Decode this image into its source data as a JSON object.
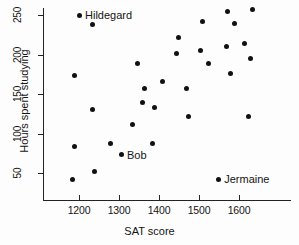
{
  "chart_data": {
    "type": "scatter",
    "title": "",
    "xlabel": "SAT score",
    "ylabel": "Hours spent studying",
    "xlim": [
      1150,
      1670
    ],
    "ylim": [
      20,
      270
    ],
    "grid": false,
    "legend": null,
    "xticks": [
      1200,
      1300,
      1400,
      1500,
      1600
    ],
    "yticks": [
      50,
      100,
      150,
      200,
      250
    ],
    "points": [
      {
        "x": 1200,
        "y": 250,
        "label": "Hildegard"
      },
      {
        "x": 1233,
        "y": 238,
        "label": null
      },
      {
        "x": 1188,
        "y": 173,
        "label": null
      },
      {
        "x": 1233,
        "y": 131,
        "label": null
      },
      {
        "x": 1188,
        "y": 83,
        "label": null
      },
      {
        "x": 1278,
        "y": 87,
        "label": null
      },
      {
        "x": 1238,
        "y": 52,
        "label": null
      },
      {
        "x": 1183,
        "y": 42,
        "label": null
      },
      {
        "x": 1333,
        "y": 112,
        "label": null
      },
      {
        "x": 1305,
        "y": 73,
        "label": "Bob"
      },
      {
        "x": 1345,
        "y": 189,
        "label": null
      },
      {
        "x": 1363,
        "y": 157,
        "label": null
      },
      {
        "x": 1358,
        "y": 139,
        "label": null
      },
      {
        "x": 1388,
        "y": 133,
        "label": null
      },
      {
        "x": 1408,
        "y": 166,
        "label": null
      },
      {
        "x": 1383,
        "y": 88,
        "label": null
      },
      {
        "x": 1448,
        "y": 221,
        "label": null
      },
      {
        "x": 1443,
        "y": 201,
        "label": null
      },
      {
        "x": 1468,
        "y": 157,
        "label": null
      },
      {
        "x": 1473,
        "y": 122,
        "label": null
      },
      {
        "x": 1508,
        "y": 242,
        "label": null
      },
      {
        "x": 1503,
        "y": 205,
        "label": null
      },
      {
        "x": 1523,
        "y": 189,
        "label": null
      },
      {
        "x": 1570,
        "y": 255,
        "label": null
      },
      {
        "x": 1588,
        "y": 239,
        "label": null
      },
      {
        "x": 1568,
        "y": 210,
        "label": null
      },
      {
        "x": 1578,
        "y": 176,
        "label": null
      },
      {
        "x": 1633,
        "y": 257,
        "label": null
      },
      {
        "x": 1613,
        "y": 214,
        "label": null
      },
      {
        "x": 1628,
        "y": 195,
        "label": null
      },
      {
        "x": 1623,
        "y": 122,
        "label": null
      },
      {
        "x": 1548,
        "y": 42,
        "label": "Jermaine"
      }
    ]
  },
  "axes": {
    "x_title": "SAT score",
    "y_title": "Hours spent studying",
    "x_tick_labels": [
      "1200",
      "1300",
      "1400",
      "1500",
      "1600"
    ],
    "y_tick_labels": [
      "50",
      "100",
      "150",
      "200",
      "250"
    ]
  },
  "annotations": [
    {
      "name": "hildegard",
      "text": "Hildegard"
    },
    {
      "name": "bob",
      "text": "Bob"
    },
    {
      "name": "jermaine",
      "text": "Jermaine"
    }
  ],
  "colors": {
    "point": "#111111",
    "axis": "#222222",
    "text": "#141414",
    "background": "#fdfdfd"
  }
}
